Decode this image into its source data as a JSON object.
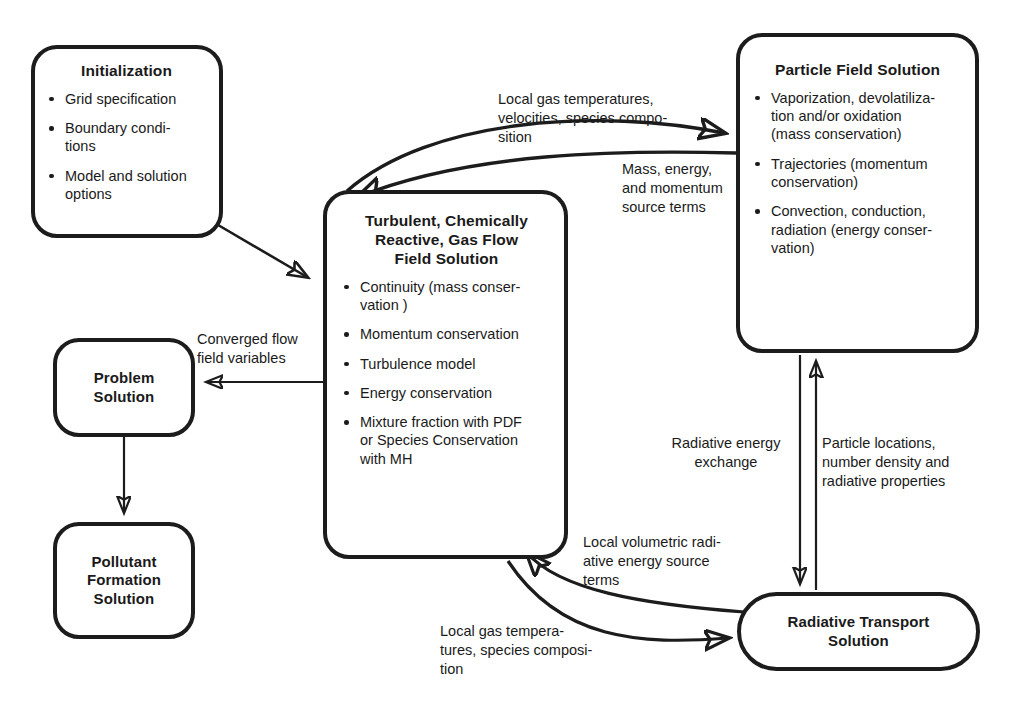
{
  "diagram": {
    "accent_color": "#1c1c1c",
    "background_color": "#ffffff"
  },
  "nodes": {
    "initialization": {
      "title": "Initialization",
      "bullets": [
        "Grid specification",
        "Boundary condi-\ntions",
        "Model and solution\noptions"
      ]
    },
    "gas_flow": {
      "title": "Turbulent, Chemically\nReactive, Gas Flow\nField Solution",
      "bullets": [
        "Continuity (mass conser-\nvation )",
        "Momentum conservation",
        "Turbulence model",
        "Energy conservation",
        "Mixture fraction with PDF\nor Species Conservation\nwith MH"
      ]
    },
    "particle_field": {
      "title": "Particle Field Solution",
      "bullets": [
        "Vaporization, devolatiliza-\ntion and/or oxidation\n(mass conservation)",
        "Trajectories (momentum\nconservation)",
        "Convection, conduction,\nradiation (energy conser-\nvation)"
      ]
    },
    "problem_solution": {
      "title": "Problem\nSolution"
    },
    "pollutant_formation": {
      "title": "Pollutant\nFormation\nSolution"
    },
    "radiative_transport": {
      "title": "Radiative Transport\nSolution"
    }
  },
  "edge_labels": {
    "gas_to_particle": "Local gas temperatures,\nvelocities, species compo-\nsition",
    "particle_to_gas": "Mass, energy,\nand momentum\nsource terms",
    "converged_flow": "Converged flow\nfield variables",
    "radiative_energy_exchange": "Radiative energy\nexchange",
    "particle_locations": "Particle locations,\nnumber density and\nradiative properties",
    "local_volumetric": "Local volumetric radi-\native energy source\nterms",
    "local_gas_bottom": "Local gas tempera-\ntures, species composi-\ntion"
  }
}
